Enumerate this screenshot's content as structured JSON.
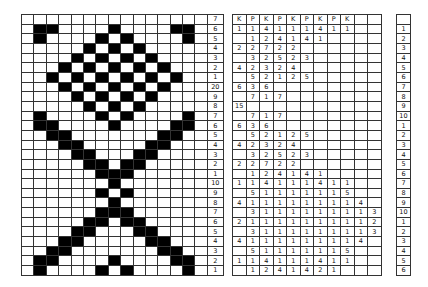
{
  "chart": {
    "columns": 15,
    "row_labels": [
      "7",
      "6",
      "5",
      "4",
      "3",
      "2",
      "1",
      "20",
      "9",
      "8",
      "7",
      "6",
      "5",
      "4",
      "3",
      "2",
      "1",
      "10",
      "9",
      "8",
      "7",
      "6",
      "5",
      "4",
      "3",
      "2",
      "1"
    ],
    "rows": [
      "000000000000000",
      "011000010000110",
      "010000101000010",
      "000001010100000",
      "000010101010000",
      "000101010101000",
      "001010101010100",
      "000101010101000",
      "000010101010000",
      "000001010100000",
      "010000101000010",
      "011000010000110",
      "001100000001100",
      "000110000011000",
      "000011000110000",
      "000001101100000",
      "000000111000000",
      "000000010000000",
      "000000101000000",
      "000000010000000",
      "000000111000000",
      "000001101100000",
      "000011000110000",
      "000110000011000",
      "001100000001100",
      "011000010000110",
      "010000101000010"
    ],
    "colors": {
      "filled": "#000000",
      "empty": "#ffffff",
      "grid": "#333333"
    }
  },
  "counts": {
    "columns": 11,
    "header": [
      "K",
      "P",
      "K",
      "P",
      "K",
      "P",
      "K",
      "P",
      "K",
      "",
      ""
    ],
    "rows": [
      [
        "1",
        "1",
        "4",
        "1",
        "1",
        "1",
        "4",
        "1",
        "1",
        "",
        ""
      ],
      [
        "",
        "1",
        "2",
        "4",
        "1",
        "4",
        "1",
        "",
        "",
        "",
        ""
      ],
      [
        "2",
        "2",
        "7",
        "2",
        "2",
        "",
        "",
        "",
        "",
        "",
        ""
      ],
      [
        "",
        "3",
        "2",
        "5",
        "2",
        "3",
        "",
        "",
        "",
        "",
        ""
      ],
      [
        "4",
        "2",
        "3",
        "2",
        "4",
        "",
        "",
        "",
        "",
        "",
        ""
      ],
      [
        "",
        "5",
        "2",
        "1",
        "2",
        "5",
        "",
        "",
        "",
        "",
        ""
      ],
      [
        "6",
        "3",
        "6",
        "",
        "",
        "",
        "",
        "",
        "",
        "",
        ""
      ],
      [
        "",
        "7",
        "1",
        "7",
        "",
        "",
        "",
        "",
        "",
        "",
        ""
      ],
      [
        "15",
        "",
        "",
        "",
        "",
        "",
        "",
        "",
        "",
        "",
        ""
      ],
      [
        "",
        "7",
        "1",
        "7",
        "",
        "",
        "",
        "",
        "",
        "",
        ""
      ],
      [
        "6",
        "3",
        "6",
        "",
        "",
        "",
        "",
        "",
        "",
        "",
        ""
      ],
      [
        "",
        "5",
        "2",
        "1",
        "2",
        "5",
        "",
        "",
        "",
        "",
        ""
      ],
      [
        "4",
        "2",
        "3",
        "2",
        "4",
        "",
        "",
        "",
        "",
        "",
        ""
      ],
      [
        "",
        "3",
        "2",
        "5",
        "2",
        "3",
        "",
        "",
        "",
        "",
        ""
      ],
      [
        "2",
        "2",
        "7",
        "2",
        "2",
        "",
        "",
        "",
        "",
        "",
        ""
      ],
      [
        "",
        "1",
        "2",
        "4",
        "1",
        "4",
        "1",
        "",
        "",
        "",
        ""
      ],
      [
        "1",
        "1",
        "4",
        "1",
        "1",
        "1",
        "4",
        "1",
        "1",
        "",
        ""
      ],
      [
        "",
        "5",
        "1",
        "1",
        "1",
        "1",
        "1",
        "1",
        "5",
        "",
        ""
      ],
      [
        "4",
        "1",
        "1",
        "1",
        "1",
        "1",
        "1",
        "1",
        "1",
        "4",
        ""
      ],
      [
        "",
        "3",
        "1",
        "1",
        "1",
        "1",
        "1",
        "1",
        "1",
        "1",
        "3"
      ],
      [
        "2",
        "1",
        "1",
        "1",
        "1",
        "1",
        "1",
        "1",
        "1",
        "1",
        "2"
      ],
      [
        "",
        "3",
        "1",
        "1",
        "1",
        "1",
        "1",
        "1",
        "1",
        "1",
        "3"
      ],
      [
        "4",
        "1",
        "1",
        "1",
        "1",
        "1",
        "1",
        "1",
        "1",
        "4",
        ""
      ],
      [
        "",
        "5",
        "1",
        "1",
        "1",
        "1",
        "1",
        "1",
        "5",
        "",
        ""
      ],
      [
        "1",
        "1",
        "4",
        "1",
        "1",
        "1",
        "4",
        "1",
        "1",
        "",
        ""
      ],
      [
        "",
        "1",
        "2",
        "4",
        "1",
        "4",
        "2",
        "1",
        "",
        "",
        ""
      ]
    ]
  },
  "row_numbers": [
    "",
    "1",
    "2",
    "3",
    "4",
    "5",
    "6",
    "7",
    "8",
    "9",
    "10",
    "1",
    "2",
    "3",
    "4",
    "5",
    "6",
    "7",
    "8",
    "9",
    "10",
    "1",
    "2",
    "3",
    "4",
    "5",
    "6"
  ]
}
